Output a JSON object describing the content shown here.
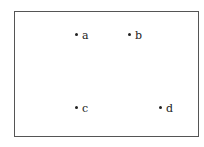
{
  "diagram": {
    "points": [
      {
        "label": "a",
        "x": 76,
        "y": 34
      },
      {
        "label": "b",
        "x": 129,
        "y": 34
      },
      {
        "label": "c",
        "x": 76,
        "y": 107
      },
      {
        "label": "d",
        "x": 160,
        "y": 107
      }
    ]
  }
}
